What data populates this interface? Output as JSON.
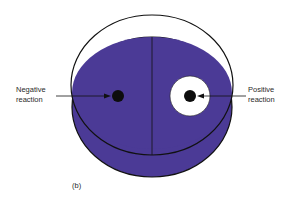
{
  "figure": {
    "caption": "(b)",
    "labels": {
      "negative": [
        "Negative",
        "reaction"
      ],
      "positive": [
        "Positive",
        "reaction"
      ]
    },
    "colors": {
      "medium": "#4b3a96",
      "outline": "#111111",
      "clear_zone": "#ffffff",
      "colony": "#0d0d0d"
    }
  }
}
